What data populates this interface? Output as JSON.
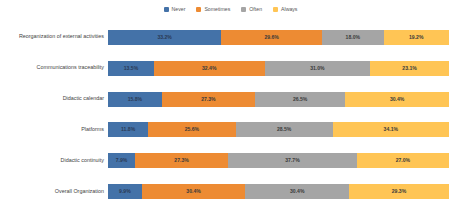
{
  "chart_data": {
    "type": "bar",
    "orientation": "horizontal",
    "stacked": true,
    "stack_mode": "percent",
    "title": "",
    "subtitle": "",
    "xlabel": "",
    "ylabel": "",
    "xlim": [
      0,
      100
    ],
    "grid": false,
    "legend_position": "top-center",
    "value_suffix": "%",
    "categories": [
      "Reorganization of external activities",
      "Communications traceability",
      "Didactic calendar",
      "Platforms",
      "Didactic continuity",
      "Overall Organization"
    ],
    "series": [
      {
        "name": "Never",
        "color": "#4472a8",
        "values": [
          33.2,
          13.5,
          15.8,
          11.8,
          7.9,
          9.9
        ],
        "labels": [
          "33.2%",
          "13.5%",
          "15.8%",
          "11.8%",
          "7.9%",
          "9.9%"
        ]
      },
      {
        "name": "Sometimes",
        "color": "#ed8b33",
        "values": [
          29.6,
          32.4,
          27.3,
          25.6,
          27.3,
          30.4
        ],
        "labels": [
          "29.6%",
          "32.4%",
          "27.3%",
          "25.6%",
          "27.3%",
          "30.4%"
        ]
      },
      {
        "name": "Often",
        "color": "#a5a5a5",
        "values": [
          18.0,
          31.0,
          26.5,
          28.5,
          37.7,
          30.4
        ],
        "labels": [
          "18.0%",
          "31.0%",
          "26.5%",
          "28.5%",
          "37.7%",
          "30.4%"
        ]
      },
      {
        "name": "Always",
        "color": "#ffc555",
        "values": [
          19.2,
          23.1,
          30.4,
          34.1,
          27.0,
          29.3
        ],
        "labels": [
          "19.2%",
          "23.1%",
          "30.4%",
          "34.1%",
          "27.0%",
          "29.3%"
        ]
      }
    ]
  }
}
